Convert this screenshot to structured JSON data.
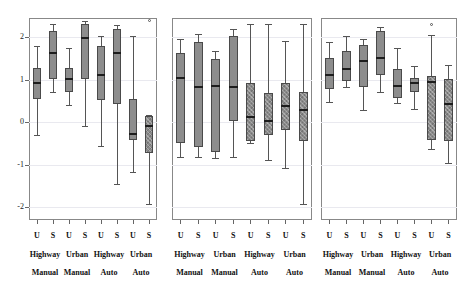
{
  "chart_data": {
    "type": "box",
    "title": "",
    "xlabel": "",
    "ylabel": "",
    "ylim": [
      -2.3,
      2.45
    ],
    "yticks": [
      2,
      1,
      0,
      -1,
      -2
    ],
    "ytick_labels": [
      "2",
      "1",
      "0",
      "-1",
      "-2"
    ],
    "grid": true,
    "legend": "none",
    "panels": [
      {
        "name": "panel-1",
        "group_labels": [
          "Highway",
          "Urban",
          "Highway",
          "Urban"
        ],
        "condition_labels": [
          "Manual",
          "Manual",
          "Auto",
          "Auto"
        ],
        "categories": [
          "U",
          "S",
          "U",
          "S",
          "U",
          "S",
          "U",
          "S"
        ],
        "boxes": [
          {
            "label": "U",
            "group": "Highway Manual",
            "hatch": false,
            "whisker_low": -0.3,
            "q1": 0.55,
            "median": 0.92,
            "q3": 1.28,
            "whisker_high": 1.78
          },
          {
            "label": "S",
            "group": "Highway Manual",
            "hatch": false,
            "whisker_low": 0.72,
            "q1": 1.02,
            "median": 1.62,
            "q3": 2.15,
            "whisker_high": 2.3
          },
          {
            "label": "U",
            "group": "Urban Manual",
            "hatch": false,
            "whisker_low": 0.4,
            "q1": 0.72,
            "median": 1.02,
            "q3": 1.28,
            "whisker_high": 1.75
          },
          {
            "label": "S",
            "group": "Urban Manual",
            "hatch": false,
            "whisker_low": -0.1,
            "q1": 1.02,
            "median": 1.98,
            "q3": 2.32,
            "whisker_high": 2.38
          },
          {
            "label": "U",
            "group": "Highway Auto",
            "hatch": false,
            "whisker_low": -0.55,
            "q1": 0.52,
            "median": 1.12,
            "q3": 1.78,
            "whisker_high": 2.02
          },
          {
            "label": "S",
            "group": "Highway Auto",
            "hatch": false,
            "whisker_low": -1.45,
            "q1": 0.42,
            "median": 1.62,
            "q3": 2.18,
            "whisker_high": 2.28
          },
          {
            "label": "U",
            "group": "Urban Auto",
            "hatch": false,
            "whisker_low": -1.18,
            "q1": -0.42,
            "median": -0.28,
            "q3": 0.55,
            "whisker_high": 2.02
          },
          {
            "label": "S",
            "group": "Urban Auto",
            "hatch": true,
            "whisker_low": -1.92,
            "q1": -0.72,
            "median": -0.08,
            "q3": 0.15,
            "whisker_high": 0.18
          }
        ],
        "outliers": [
          {
            "box_index": 7,
            "value": 2.4
          }
        ]
      },
      {
        "name": "panel-2",
        "group_labels": [
          "Highway",
          "Urban",
          "Highway",
          "Urban"
        ],
        "condition_labels": [
          "Manual",
          "Manual",
          "Auto",
          "Auto"
        ],
        "categories": [
          "U",
          "S",
          "U",
          "S",
          "U",
          "S",
          "U",
          "S"
        ],
        "boxes": [
          {
            "label": "U",
            "group": "Highway Manual",
            "hatch": false,
            "whisker_low": -0.82,
            "q1": -0.5,
            "median": 1.05,
            "q3": 1.62,
            "whisker_high": 1.95
          },
          {
            "label": "S",
            "group": "Highway Manual",
            "hatch": false,
            "whisker_low": -0.82,
            "q1": -0.58,
            "median": 0.82,
            "q3": 1.88,
            "whisker_high": 2.08
          },
          {
            "label": "U",
            "group": "Urban Manual",
            "hatch": false,
            "whisker_low": -0.85,
            "q1": -0.7,
            "median": 0.85,
            "q3": 1.48,
            "whisker_high": 1.68
          },
          {
            "label": "S",
            "group": "Urban Manual",
            "hatch": false,
            "whisker_low": -0.82,
            "q1": 0.02,
            "median": 0.82,
            "q3": 2.02,
            "whisker_high": 2.18
          },
          {
            "label": "U",
            "group": "Highway Auto",
            "hatch": true,
            "whisker_low": -0.48,
            "q1": -0.45,
            "median": 0.12,
            "q3": 0.92,
            "whisker_high": 2.3
          },
          {
            "label": "S",
            "group": "Highway Auto",
            "hatch": true,
            "whisker_low": -0.88,
            "q1": -0.3,
            "median": 0.02,
            "q3": 0.68,
            "whisker_high": 2.32
          },
          {
            "label": "U",
            "group": "Urban Auto",
            "hatch": true,
            "whisker_low": -1.08,
            "q1": -0.18,
            "median": 0.38,
            "q3": 0.92,
            "whisker_high": 1.92
          },
          {
            "label": "S",
            "group": "Urban Auto",
            "hatch": true,
            "whisker_low": -1.92,
            "q1": -0.45,
            "median": 0.28,
            "q3": 0.72,
            "whisker_high": 2.3
          }
        ],
        "outliers": []
      },
      {
        "name": "panel-3",
        "group_labels": [
          "Highway",
          "Urban",
          "Highway",
          "Urban"
        ],
        "condition_labels": [
          "Manual",
          "Manual",
          "Auto",
          "Auto"
        ],
        "categories": [
          "U",
          "S",
          "U",
          "S",
          "U",
          "S",
          "U",
          "S"
        ],
        "boxes": [
          {
            "label": "U",
            "group": "Highway Manual",
            "hatch": false,
            "whisker_low": 0.48,
            "q1": 0.78,
            "median": 1.12,
            "q3": 1.52,
            "whisker_high": 1.88
          },
          {
            "label": "S",
            "group": "Highway Manual",
            "hatch": false,
            "whisker_low": 0.82,
            "q1": 0.98,
            "median": 1.25,
            "q3": 1.68,
            "whisker_high": 2.02
          },
          {
            "label": "U",
            "group": "Urban Manual",
            "hatch": false,
            "whisker_low": 0.28,
            "q1": 0.82,
            "median": 1.45,
            "q3": 1.82,
            "whisker_high": 1.95
          },
          {
            "label": "S",
            "group": "Urban Manual",
            "hatch": false,
            "whisker_low": 0.72,
            "q1": 1.12,
            "median": 1.52,
            "q3": 2.15,
            "whisker_high": 2.25
          },
          {
            "label": "U",
            "group": "Highway Auto",
            "hatch": false,
            "whisker_low": 0.45,
            "q1": 0.58,
            "median": 0.85,
            "q3": 1.25,
            "whisker_high": 1.75
          },
          {
            "label": "S",
            "group": "Highway Auto",
            "hatch": false,
            "whisker_low": 0.32,
            "q1": 0.72,
            "median": 0.92,
            "q3": 1.05,
            "whisker_high": 1.32
          },
          {
            "label": "U",
            "group": "Urban Auto",
            "hatch": true,
            "whisker_low": -0.62,
            "q1": -0.42,
            "median": 0.95,
            "q3": 1.08,
            "whisker_high": 2.05
          },
          {
            "label": "S",
            "group": "Urban Auto",
            "hatch": true,
            "whisker_low": -0.95,
            "q1": -0.45,
            "median": 0.42,
            "q3": 1.02,
            "whisker_high": 1.35
          }
        ],
        "outliers": [
          {
            "box_index": 6,
            "value": 2.3
          }
        ]
      }
    ]
  }
}
